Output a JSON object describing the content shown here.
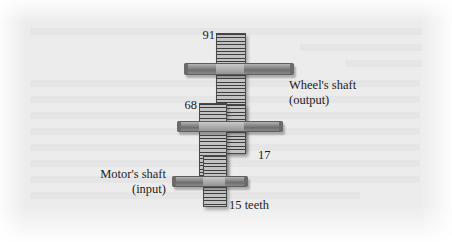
{
  "figure": {
    "type": "gear-train-diagram",
    "background_color": "#ececec",
    "gear_fill_color": "#a9a9a9",
    "shaft_color": "#8f8f8f",
    "text_color": "#1d1d1d"
  },
  "labels": {
    "gear_top": "91",
    "gear_middle_left": "68",
    "gear_middle_right": "17",
    "gear_bottom": "15 teeth",
    "output_shaft_line1": "Wheel's shaft",
    "output_shaft_line2": "(output)",
    "input_shaft_line1": "Motor's shaft",
    "input_shaft_line2": "(input)"
  },
  "gears": [
    {
      "name": "gear-91",
      "teeth": 91,
      "shaft": "wheel-output"
    },
    {
      "name": "gear-68",
      "teeth": 68,
      "shaft": "intermediate"
    },
    {
      "name": "gear-17",
      "teeth": 17,
      "shaft": "wheel-output"
    },
    {
      "name": "gear-15",
      "teeth": 15,
      "shaft": "motor-input"
    }
  ],
  "shafts": [
    {
      "name": "wheel-output-shaft",
      "role": "output"
    },
    {
      "name": "intermediate-shaft",
      "role": "intermediate"
    },
    {
      "name": "motor-input-shaft",
      "role": "input"
    }
  ]
}
